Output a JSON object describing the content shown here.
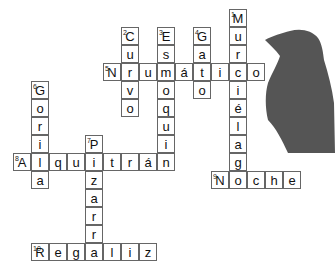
{
  "puzzle": {
    "title": "",
    "cell_size": 18,
    "origin": {
      "x": 13,
      "y": 9
    },
    "words": [
      {
        "number": 1,
        "answer": "Murciélago",
        "direction": "down",
        "row": 0,
        "col": 12
      },
      {
        "number": 2,
        "answer": "Curvo",
        "direction": "down",
        "row": 1,
        "col": 6
      },
      {
        "number": 3,
        "answer": "Esmoquin",
        "direction": "down",
        "row": 1,
        "col": 8
      },
      {
        "number": 4,
        "answer": "Gato",
        "direction": "down",
        "row": 1,
        "col": 10
      },
      {
        "number": 5,
        "answer": "Neumático",
        "direction": "across",
        "row": 3,
        "col": 5
      },
      {
        "number": 6,
        "answer": "Gorila",
        "direction": "down",
        "row": 4,
        "col": 1
      },
      {
        "number": 7,
        "answer": "Pizarra",
        "direction": "down",
        "row": 7,
        "col": 4
      },
      {
        "number": 8,
        "answer": "Alquitrán",
        "direction": "across",
        "row": 8,
        "col": 0
      },
      {
        "number": 9,
        "answer": "Noche",
        "direction": "across",
        "row": 9,
        "col": 11
      },
      {
        "number": 10,
        "answer": "Regaliz",
        "direction": "across",
        "row": 13,
        "col": 1
      }
    ]
  },
  "image": {
    "subject": "crow-silhouette",
    "color": "#555555"
  }
}
